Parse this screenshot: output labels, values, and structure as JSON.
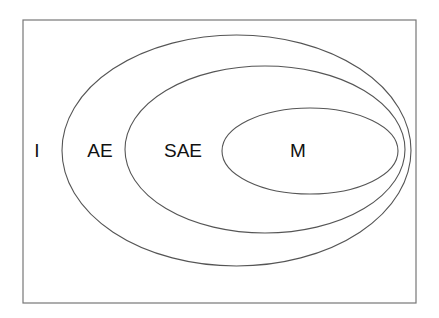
{
  "diagram": {
    "type": "nested-ellipse-venn",
    "frame": {
      "x": 23,
      "y": 20,
      "width": 393,
      "height": 283
    },
    "regions": [
      {
        "id": "I",
        "label": "I",
        "label_x": 37,
        "label_y": 152
      },
      {
        "id": "AE",
        "label": "AE",
        "label_x": 100,
        "label_y": 152,
        "ellipse": {
          "cx": 236.5,
          "cy": 150.5,
          "rx": 174.5,
          "ry": 115.5
        }
      },
      {
        "id": "SAE",
        "label": "SAE",
        "label_x": 183,
        "label_y": 152,
        "ellipse": {
          "cx": 265,
          "cy": 149.5,
          "rx": 140,
          "ry": 83.5
        }
      },
      {
        "id": "M",
        "label": "M",
        "label_x": 298,
        "label_y": 152,
        "ellipse": {
          "cx": 310,
          "cy": 151,
          "rx": 88,
          "ry": 43
        }
      }
    ],
    "containment": [
      "M ⊂ SAE",
      "SAE ⊂ AE",
      "AE ⊂ I"
    ],
    "colors": {
      "stroke": "#555555",
      "frame": "#777777",
      "text": "#111111",
      "background": "#ffffff"
    }
  }
}
